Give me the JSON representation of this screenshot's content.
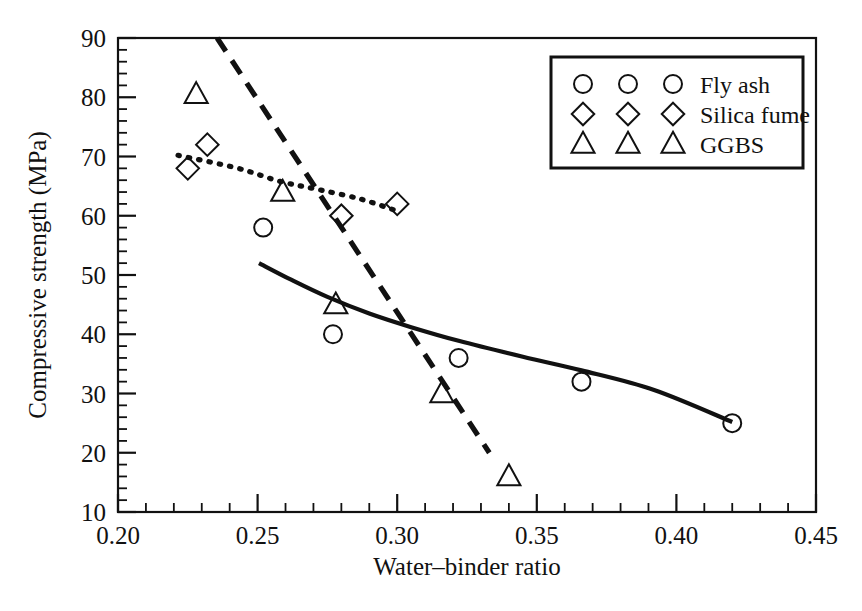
{
  "chart_data": {
    "type": "scatter",
    "title": "",
    "xlabel": "Water–binder ratio",
    "ylabel": "Compressive strength (MPa)",
    "xlim": [
      0.2,
      0.45
    ],
    "ylim": [
      10,
      90
    ],
    "grid": false,
    "legend_position": "top-right",
    "x_ticks": [
      "0.20",
      "0.25",
      "0.30",
      "0.35",
      "0.40",
      "0.45"
    ],
    "x_tick_values": [
      0.2,
      0.25,
      0.3,
      0.35,
      0.4,
      0.45
    ],
    "y_ticks": [
      "10",
      "20",
      "30",
      "40",
      "50",
      "60",
      "70",
      "80",
      "90"
    ],
    "y_tick_values": [
      10,
      20,
      30,
      40,
      50,
      60,
      70,
      80,
      90
    ],
    "x_minor_tick_step": 0.01,
    "y_minor_tick_step": 2,
    "series": [
      {
        "name": "Fly ash",
        "marker": "circle",
        "line_style": "solid",
        "points": [
          {
            "x": 0.252,
            "y": 58
          },
          {
            "x": 0.277,
            "y": 40
          },
          {
            "x": 0.322,
            "y": 36
          },
          {
            "x": 0.366,
            "y": 32
          },
          {
            "x": 0.42,
            "y": 25
          }
        ],
        "fit_curve": [
          {
            "x": 0.2505,
            "y": 52.0
          },
          {
            "x": 0.262,
            "y": 49.2
          },
          {
            "x": 0.275,
            "y": 46.3
          },
          {
            "x": 0.29,
            "y": 43.5
          },
          {
            "x": 0.305,
            "y": 41.2
          },
          {
            "x": 0.322,
            "y": 38.9
          },
          {
            "x": 0.345,
            "y": 36.2
          },
          {
            "x": 0.366,
            "y": 33.9
          },
          {
            "x": 0.392,
            "y": 30.6
          },
          {
            "x": 0.42,
            "y": 25.2
          }
        ]
      },
      {
        "name": "Silica fume",
        "marker": "diamond",
        "line_style": "dotted",
        "points": [
          {
            "x": 0.225,
            "y": 68
          },
          {
            "x": 0.232,
            "y": 72
          },
          {
            "x": 0.28,
            "y": 60
          },
          {
            "x": 0.3,
            "y": 62
          }
        ],
        "fit_curve": [
          {
            "x": 0.2215,
            "y": 70.2
          },
          {
            "x": 0.243,
            "y": 68.0
          },
          {
            "x": 0.258,
            "y": 65.8
          },
          {
            "x": 0.272,
            "y": 64.4
          },
          {
            "x": 0.287,
            "y": 62.8
          },
          {
            "x": 0.3,
            "y": 60.8
          }
        ]
      },
      {
        "name": "GGBS",
        "marker": "triangle",
        "line_style": "dashed",
        "points": [
          {
            "x": 0.228,
            "y": 80.5
          },
          {
            "x": 0.259,
            "y": 64
          },
          {
            "x": 0.278,
            "y": 45
          },
          {
            "x": 0.316,
            "y": 30
          },
          {
            "x": 0.34,
            "y": 16
          }
        ],
        "fit_curve": [
          {
            "x": 0.2355,
            "y": 90.0
          },
          {
            "x": 0.333,
            "y": 20.0
          }
        ]
      }
    ]
  },
  "legend": {
    "entries": [
      {
        "label": "Fly ash",
        "marker": "circle",
        "marker_count": 3
      },
      {
        "label": "Silica fume",
        "marker": "diamond",
        "marker_count": 3
      },
      {
        "label": "GGBS",
        "marker": "triangle",
        "marker_count": 3
      }
    ]
  }
}
